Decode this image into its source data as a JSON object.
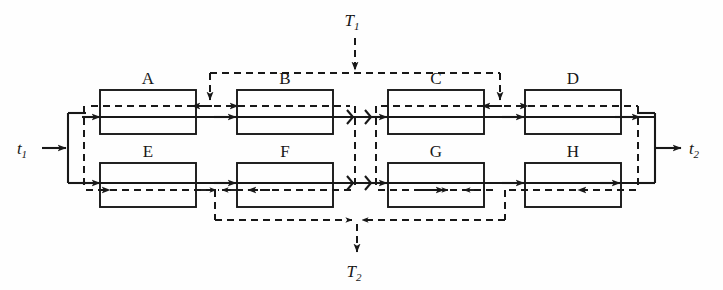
{
  "figure": {
    "background_color": "#fefefe",
    "ink_color": "#181818",
    "sections": [
      {
        "id": "A",
        "label": "A",
        "row": "top",
        "x": 100,
        "y": 90,
        "w": 96,
        "h": 44
      },
      {
        "id": "B",
        "label": "B",
        "row": "top",
        "x": 237,
        "y": 90,
        "w": 96,
        "h": 44
      },
      {
        "id": "C",
        "label": "C",
        "row": "top",
        "x": 388,
        "y": 90,
        "w": 96,
        "h": 44
      },
      {
        "id": "D",
        "label": "D",
        "row": "top",
        "x": 525,
        "y": 90,
        "w": 96,
        "h": 44
      },
      {
        "id": "E",
        "label": "E",
        "row": "bottom",
        "x": 100,
        "y": 163,
        "w": 96,
        "h": 44
      },
      {
        "id": "F",
        "label": "F",
        "row": "bottom",
        "x": 237,
        "y": 163,
        "w": 96,
        "h": 44
      },
      {
        "id": "G",
        "label": "G",
        "row": "bottom",
        "x": 388,
        "y": 163,
        "w": 96,
        "h": 44
      },
      {
        "id": "H",
        "label": "H",
        "row": "bottom",
        "x": 525,
        "y": 163,
        "w": 96,
        "h": 44
      }
    ],
    "flow_labels": [
      {
        "name": "inlet-temperature",
        "base": "t",
        "sub": "1",
        "x": 22,
        "y": 154,
        "side": "left"
      },
      {
        "name": "outlet-temperature",
        "base": "t",
        "sub": "2",
        "x": 690,
        "y": 154,
        "side": "right"
      },
      {
        "name": "secondary-inlet-temperature",
        "base": "T",
        "sub": "1",
        "x": 355,
        "y": 22,
        "side": "top"
      },
      {
        "name": "secondary-outlet-temperature",
        "base": "T",
        "sub": "2",
        "x": 355,
        "y": 278,
        "side": "bottom"
      }
    ],
    "streams": [
      {
        "name": "primary-stream",
        "style": "solid",
        "from": "t1",
        "to": "t2"
      },
      {
        "name": "secondary-stream",
        "style": "dashed",
        "from": "T1",
        "to": "T2"
      }
    ]
  }
}
